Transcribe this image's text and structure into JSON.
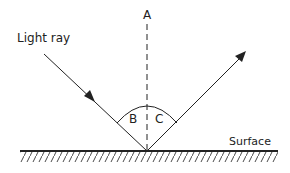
{
  "diagram": {
    "type": "reflection-of-light",
    "labels": {
      "light_ray": "Light ray",
      "normal": "A",
      "angle_incidence": "B",
      "angle_reflection": "C",
      "surface": "Surface"
    },
    "colors": {
      "stroke": "#222222",
      "background": "#ffffff"
    }
  }
}
